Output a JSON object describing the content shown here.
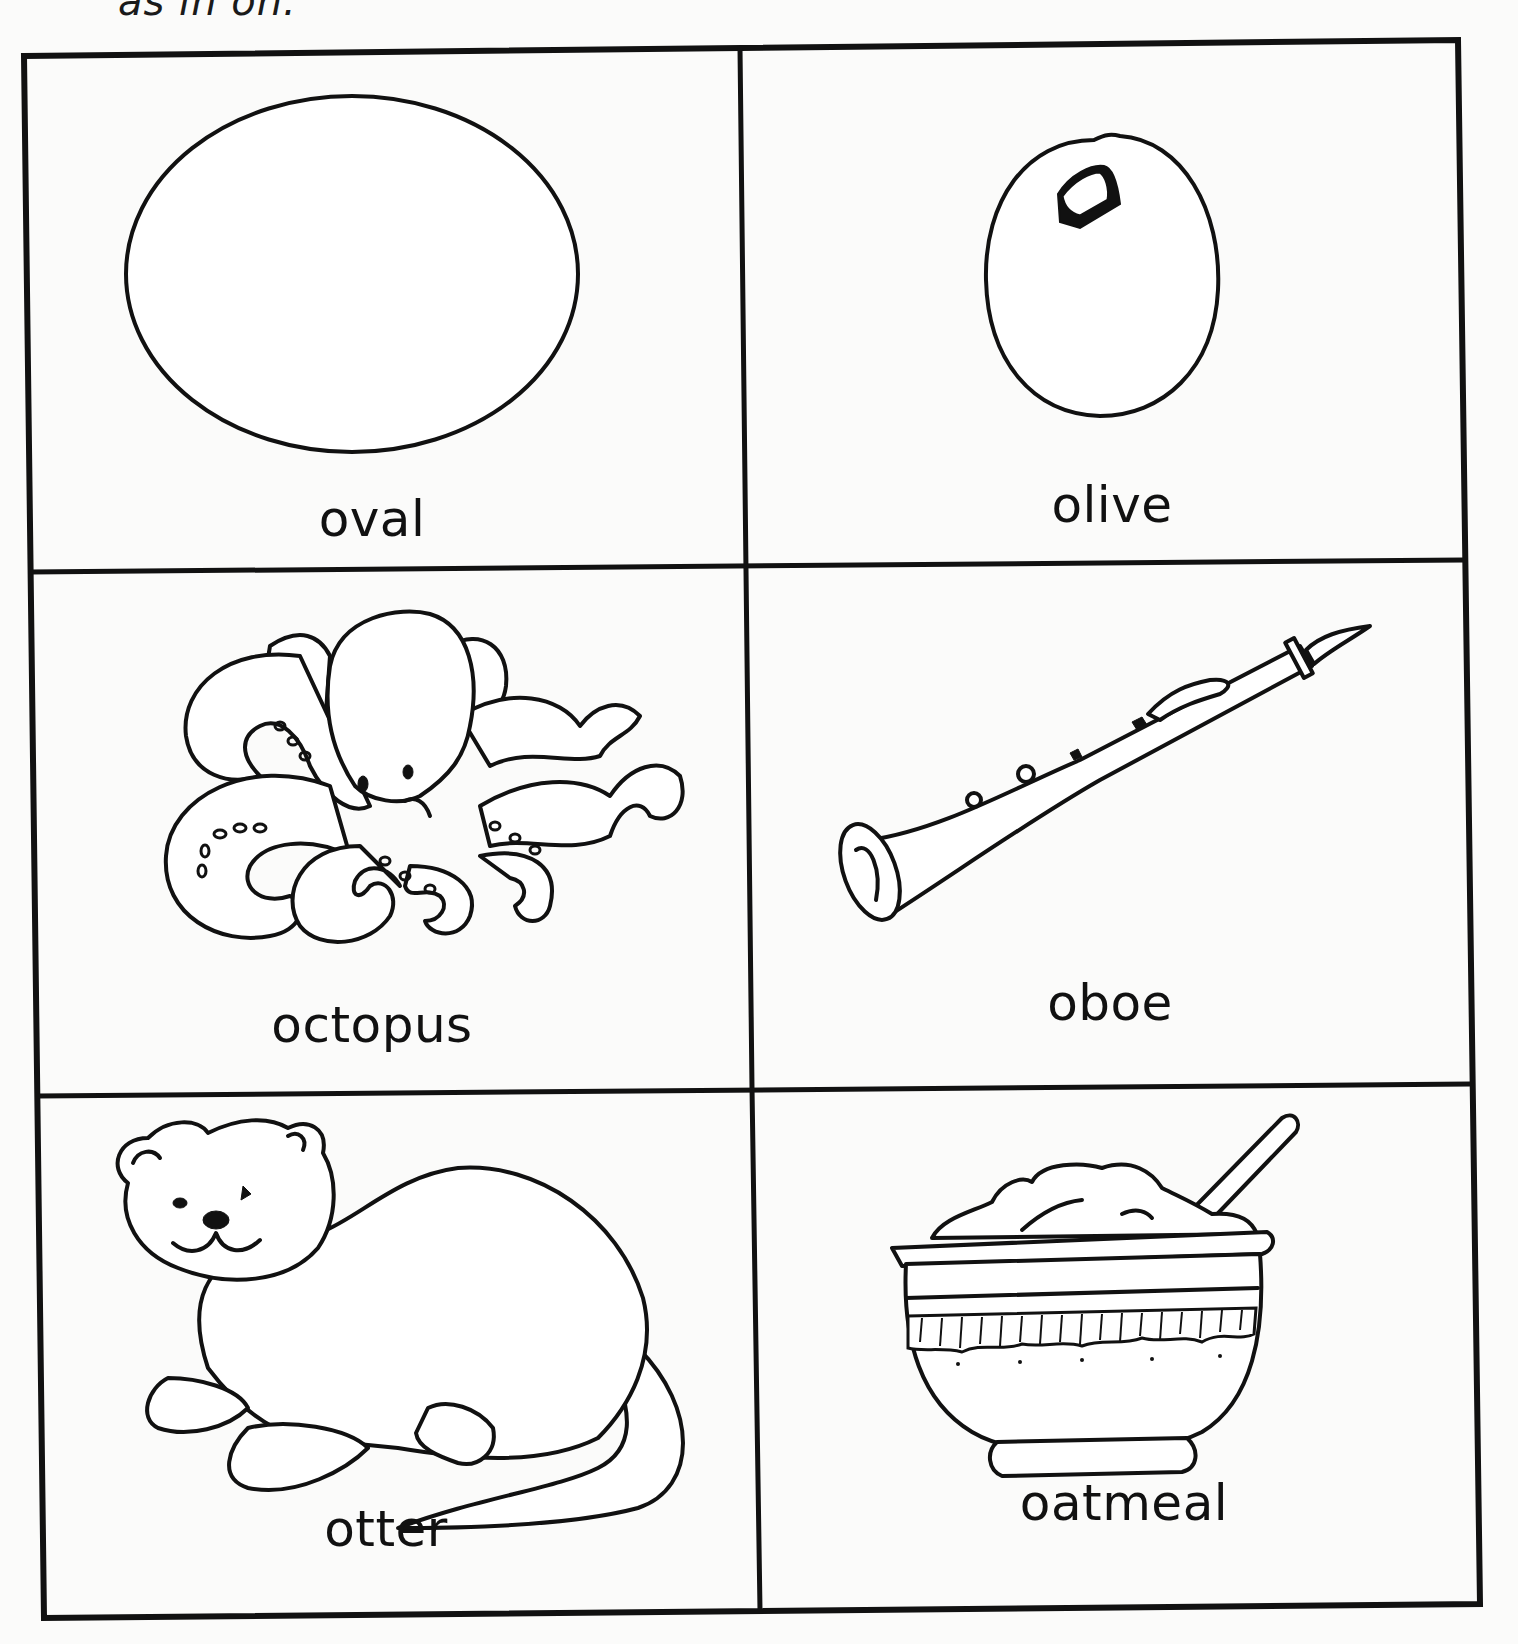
{
  "header": {
    "text": "as in on."
  },
  "grid": {
    "rows": 3,
    "cols": 2,
    "border_color": "#111111"
  },
  "cards": [
    {
      "word": "oval",
      "picture": "oval-shape"
    },
    {
      "word": "olive",
      "picture": "olive"
    },
    {
      "word": "octopus",
      "picture": "octopus"
    },
    {
      "word": "oboe",
      "picture": "oboe"
    },
    {
      "word": "otter",
      "picture": "otter"
    },
    {
      "word": "oatmeal",
      "picture": "oatmeal-bowl"
    }
  ]
}
